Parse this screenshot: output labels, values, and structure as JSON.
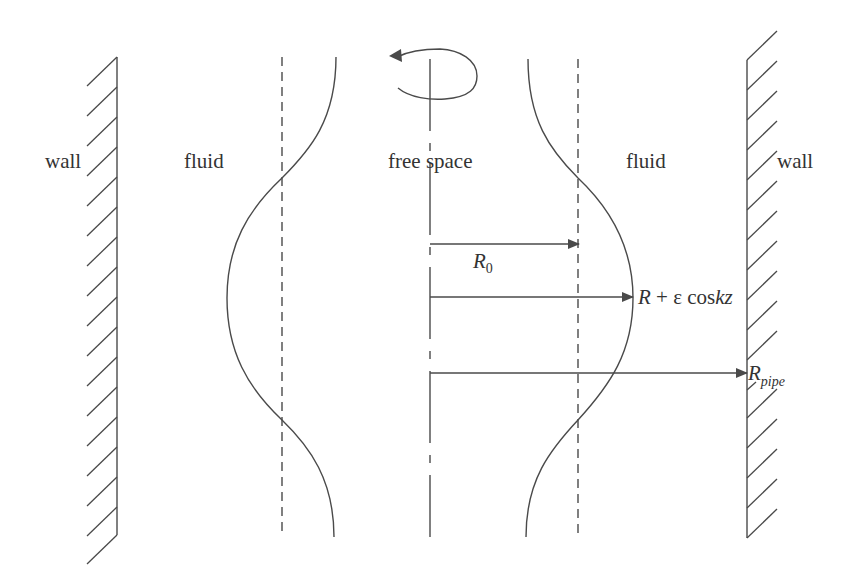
{
  "diagram": {
    "labels": {
      "left_wall": "wall",
      "left_fluid": "fluid",
      "center": "free space",
      "right_fluid": "fluid",
      "right_wall": "wall"
    },
    "radii": {
      "r0": {
        "base": "R",
        "sub": "0"
      },
      "perturbed": {
        "base": "R",
        "op": " + ",
        "eps": "ε",
        "func": " cos",
        "arg": "kz"
      },
      "pipe": {
        "base": "R",
        "sub": "pipe"
      }
    },
    "icons": {
      "rotation": "rotation-arrow-icon"
    },
    "colors": {
      "stroke": "#4a4a4a",
      "text": "#333333",
      "background": "#ffffff"
    }
  }
}
